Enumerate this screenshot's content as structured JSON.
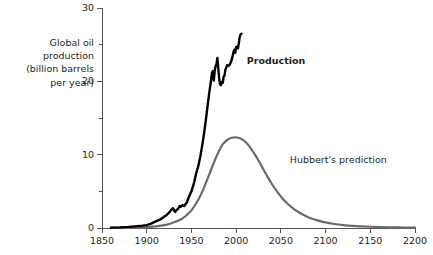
{
  "chart_data": {
    "type": "line",
    "title": "",
    "subtitle": "",
    "xlabel": "",
    "ylabel": "Global oil production (billion barrels per year)",
    "ylabel_lines": [
      "Global oil",
      "production",
      "(billion barrels",
      "per year)"
    ],
    "xlim": [
      1850,
      2200
    ],
    "ylim": [
      0,
      30
    ],
    "grid": false,
    "legend_position": "inline-annotation",
    "x_ticks": [
      1850,
      1900,
      1950,
      2000,
      2050,
      2100,
      2150,
      2200
    ],
    "x_tick_labels": [
      "1850",
      "1900",
      "1950",
      "2000",
      "2050",
      "2100",
      "2150",
      "2200"
    ],
    "y_ticks": [
      0,
      10,
      20,
      30
    ],
    "y_tick_labels": [
      "0",
      "10",
      "20",
      "30"
    ],
    "y_minor_ticks": [
      5,
      15,
      25
    ],
    "annotations": [
      {
        "text": "Production",
        "x": 2012,
        "y": 22.8,
        "bold": true
      },
      {
        "text": "Hubbert's prediction",
        "x": 2060,
        "y": 9.3,
        "bold": false
      }
    ],
    "series": [
      {
        "name": "Production",
        "color": "#000000",
        "width": 2.4,
        "points": [
          [
            1860,
            0.05
          ],
          [
            1870,
            0.08
          ],
          [
            1880,
            0.15
          ],
          [
            1890,
            0.25
          ],
          [
            1895,
            0.3
          ],
          [
            1900,
            0.4
          ],
          [
            1905,
            0.6
          ],
          [
            1910,
            0.9
          ],
          [
            1913,
            1.05
          ],
          [
            1915,
            1.15
          ],
          [
            1918,
            1.4
          ],
          [
            1920,
            1.6
          ],
          [
            1922,
            1.75
          ],
          [
            1925,
            2.1
          ],
          [
            1927,
            2.4
          ],
          [
            1929,
            2.7
          ],
          [
            1930,
            2.6
          ],
          [
            1931,
            2.3
          ],
          [
            1932,
            2.2
          ],
          [
            1933,
            2.4
          ],
          [
            1935,
            2.6
          ],
          [
            1937,
            3.0
          ],
          [
            1938,
            2.9
          ],
          [
            1940,
            3.1
          ],
          [
            1942,
            3.0
          ],
          [
            1945,
            3.5
          ],
          [
            1947,
            4.2
          ],
          [
            1950,
            5.0
          ],
          [
            1953,
            6.2
          ],
          [
            1955,
            7.3
          ],
          [
            1958,
            8.6
          ],
          [
            1960,
            9.8
          ],
          [
            1962,
            11.2
          ],
          [
            1964,
            12.8
          ],
          [
            1966,
            14.6
          ],
          [
            1968,
            16.6
          ],
          [
            1970,
            18.5
          ],
          [
            1972,
            20.2
          ],
          [
            1973,
            21.2
          ],
          [
            1974,
            21.4
          ],
          [
            1975,
            20.1
          ],
          [
            1976,
            21.4
          ],
          [
            1977,
            22.1
          ],
          [
            1978,
            22.3
          ],
          [
            1979,
            23.2
          ],
          [
            1980,
            21.8
          ],
          [
            1981,
            20.4
          ],
          [
            1982,
            19.6
          ],
          [
            1983,
            19.5
          ],
          [
            1984,
            19.9
          ],
          [
            1985,
            19.8
          ],
          [
            1986,
            20.6
          ],
          [
            1987,
            20.8
          ],
          [
            1988,
            21.6
          ],
          [
            1989,
            21.9
          ],
          [
            1990,
            22.2
          ],
          [
            1991,
            22.1
          ],
          [
            1992,
            22.2
          ],
          [
            1993,
            22.3
          ],
          [
            1994,
            22.6
          ],
          [
            1995,
            22.9
          ],
          [
            1996,
            23.4
          ],
          [
            1997,
            24.0
          ],
          [
            1998,
            24.3
          ],
          [
            1999,
            23.9
          ],
          [
            2000,
            24.7
          ],
          [
            2001,
            24.7
          ],
          [
            2002,
            24.5
          ],
          [
            2003,
            25.2
          ],
          [
            2004,
            26.1
          ],
          [
            2005,
            26.4
          ],
          [
            2006,
            26.5
          ]
        ]
      },
      {
        "name": "Hubbert's prediction",
        "color": "#6b6b6b",
        "width": 2.2,
        "peak_year": 2000,
        "peak_value": 12.3,
        "points": [
          [
            1860,
            0.02
          ],
          [
            1880,
            0.05
          ],
          [
            1900,
            0.12
          ],
          [
            1910,
            0.22
          ],
          [
            1920,
            0.4
          ],
          [
            1930,
            0.75
          ],
          [
            1940,
            1.3
          ],
          [
            1945,
            1.8
          ],
          [
            1950,
            2.4
          ],
          [
            1955,
            3.3
          ],
          [
            1960,
            4.4
          ],
          [
            1965,
            5.8
          ],
          [
            1970,
            7.3
          ],
          [
            1975,
            8.9
          ],
          [
            1980,
            10.3
          ],
          [
            1985,
            11.4
          ],
          [
            1990,
            12.0
          ],
          [
            1995,
            12.3
          ],
          [
            2000,
            12.35
          ],
          [
            2005,
            12.2
          ],
          [
            2010,
            11.8
          ],
          [
            2015,
            11.1
          ],
          [
            2020,
            10.2
          ],
          [
            2025,
            9.2
          ],
          [
            2030,
            8.1
          ],
          [
            2035,
            7.0
          ],
          [
            2040,
            6.0
          ],
          [
            2045,
            5.1
          ],
          [
            2050,
            4.3
          ],
          [
            2055,
            3.6
          ],
          [
            2060,
            3.05
          ],
          [
            2065,
            2.55
          ],
          [
            2070,
            2.15
          ],
          [
            2075,
            1.8
          ],
          [
            2080,
            1.5
          ],
          [
            2085,
            1.27
          ],
          [
            2090,
            1.07
          ],
          [
            2095,
            0.9
          ],
          [
            2100,
            0.76
          ],
          [
            2110,
            0.55
          ],
          [
            2120,
            0.4
          ],
          [
            2130,
            0.29
          ],
          [
            2140,
            0.22
          ],
          [
            2150,
            0.17
          ],
          [
            2160,
            0.13
          ],
          [
            2170,
            0.1
          ],
          [
            2180,
            0.08
          ],
          [
            2190,
            0.06
          ],
          [
            2200,
            0.05
          ]
        ]
      }
    ]
  },
  "colors": {
    "production": "#000000",
    "prediction": "#6b6b6b",
    "axis": "#555555",
    "text": "#231f20",
    "background": "#ffffff"
  }
}
